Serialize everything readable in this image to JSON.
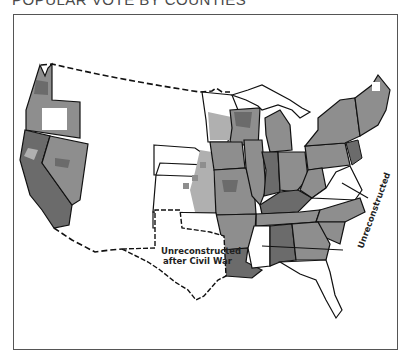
{
  "title": "POPULAR VOTE BY COUNTIES",
  "colors": {
    "dark": "#6b6b6b",
    "medium": "#8e8e8e",
    "light": "#b0b0b0",
    "unshaded": "#ffffff",
    "border": "#111111",
    "frame": "#555555"
  },
  "map": {
    "labels": {
      "unreconstructed_texas": [
        "Unreconstructed",
        "after Civil War"
      ],
      "unreconstructed_virginia": "Unreconstructed"
    },
    "notes": {
      "dashed_border": "international / territorial borders (Canada, Mexico) shown dashed",
      "unshaded_regions": [
        "Texas",
        "Virginia",
        "Mississippi",
        "Dakota/Nebraska/Kansas territory (mostly)",
        "Florida",
        "Oklahoma"
      ]
    }
  }
}
